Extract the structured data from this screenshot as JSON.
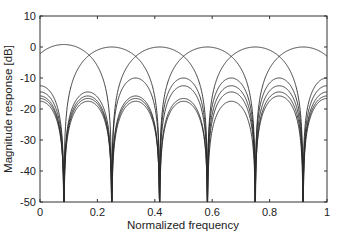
{
  "chart_data": {
    "type": "line",
    "title": "",
    "xlabel": "Normalized frequency",
    "ylabel": "Magnitude response [dB]",
    "xlim": [
      0,
      1
    ],
    "ylim": [
      -50,
      10
    ],
    "xticks": [
      0,
      0.2,
      0.4,
      0.6,
      0.8,
      1
    ],
    "xtick_labels": [
      "0",
      "0.2",
      "0.4",
      "0.6",
      "0.8",
      "1"
    ],
    "yticks": [
      10,
      0,
      -10,
      -20,
      -30,
      -40,
      -50
    ],
    "ytick_labels": [
      "10",
      "0",
      "-10",
      "-20",
      "-30",
      "-40",
      "-50"
    ],
    "grid": false,
    "legend": null,
    "null_frequencies": [
      0.083,
      0.25,
      0.417,
      0.583,
      0.75,
      0.917
    ],
    "series": [
      {
        "name": "filter 1",
        "center": 0.083,
        "peak_db": 0.8,
        "sidelobe_db": -10.0
      },
      {
        "name": "filter 2",
        "center": 0.25,
        "peak_db": 0.0,
        "sidelobe_db": -12.5
      },
      {
        "name": "filter 3",
        "center": 0.417,
        "peak_db": 0.0,
        "sidelobe_db": -14.5
      },
      {
        "name": "filter 4",
        "center": 0.583,
        "peak_db": 0.0,
        "sidelobe_db": -15.8
      },
      {
        "name": "filter 5",
        "center": 0.75,
        "peak_db": 0.0,
        "sidelobe_db": -16.6
      },
      {
        "name": "filter 6",
        "center": 0.917,
        "peak_db": 0.0,
        "sidelobe_db": -17.5
      }
    ],
    "line_color": "#2a2a2a"
  }
}
